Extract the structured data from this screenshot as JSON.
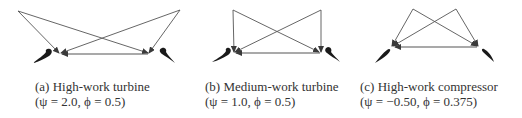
{
  "figure": {
    "panels": [
      {
        "id": "a",
        "label": "(a) High-work turbine",
        "params": "(ψ = 2.0, ϕ = 0.5)",
        "psi": 2.0,
        "phi": 0.5,
        "type": "turbine"
      },
      {
        "id": "b",
        "label": "(b) Medium-work turbine",
        "params": "(ψ = 1.0, ϕ = 0.5)",
        "psi": 1.0,
        "phi": 0.5,
        "type": "turbine"
      },
      {
        "id": "c",
        "label": "(c) High-work compressor",
        "params": "(ψ = −0.50, ϕ = 0.375)",
        "psi": -0.5,
        "phi": 0.375,
        "type": "compressor"
      }
    ],
    "colors": {
      "line": "#4a4a4a",
      "blade": "#1a1a1a",
      "text": "#333333"
    }
  }
}
